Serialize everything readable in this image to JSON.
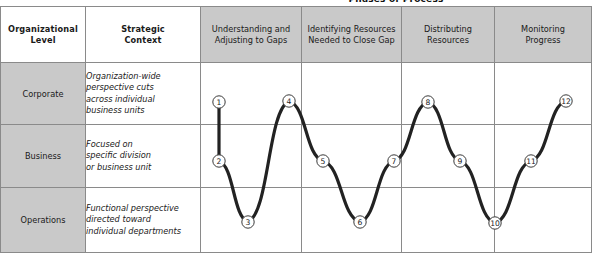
{
  "figure": {
    "super_title": "Phases of Process"
  },
  "table": {
    "headers": {
      "level": "Organizational\nLevel",
      "level_line1": "Organizational",
      "level_line2": "Level",
      "context_line1": "Strategic",
      "context_line2": "Context",
      "phases": [
        {
          "line1": "Understanding and",
          "line2": "Adjusting to Gaps"
        },
        {
          "line1": "Identifying Resources",
          "line2": "Needed to Close Gap"
        },
        {
          "line1": "Distributing",
          "line2": "Resources"
        },
        {
          "line1": "Monitoring",
          "line2": "Progress"
        }
      ]
    },
    "rows": [
      {
        "level": "Corporate",
        "context_lines": [
          "Organization-wide",
          "perspective cuts",
          "across individual",
          "business units"
        ]
      },
      {
        "level": "Business",
        "context_lines": [
          "Focused on",
          "specific division",
          "or business unit"
        ]
      },
      {
        "level": "Operations",
        "context_lines": [
          "Functional perspective",
          "directed toward",
          "individual departments"
        ]
      }
    ]
  },
  "chart_data": {
    "type": "line",
    "title": "Phases of Process",
    "xlabel": "",
    "ylabel": "Organizational Level",
    "grid": true,
    "legend": "none",
    "y_categories": [
      "Corporate",
      "Business",
      "Operations"
    ],
    "x_categories": [
      "Understanding and Adjusting to Gaps",
      "Identifying Resources Needed to Close Gap",
      "Distributing Resources",
      "Monitoring Progress"
    ],
    "series": [
      {
        "name": "Process sequence",
        "points": [
          {
            "label": "1",
            "x": 219,
            "y": 102,
            "level": "Corporate",
            "phase": "Understanding and Adjusting to Gaps"
          },
          {
            "label": "2",
            "x": 219,
            "y": 161,
            "level": "Business",
            "phase": "Understanding and Adjusting to Gaps"
          },
          {
            "label": "3",
            "x": 248,
            "y": 222,
            "level": "Operations",
            "phase": "Understanding and Adjusting to Gaps"
          },
          {
            "label": "4",
            "x": 289,
            "y": 101,
            "level": "Corporate",
            "phase": "Understanding and Adjusting to Gaps"
          },
          {
            "label": "5",
            "x": 323,
            "y": 161,
            "level": "Business",
            "phase": "Identifying Resources Needed to Close Gap"
          },
          {
            "label": "6",
            "x": 360,
            "y": 222,
            "level": "Operations",
            "phase": "Identifying Resources Needed to Close Gap"
          },
          {
            "label": "7",
            "x": 394,
            "y": 161,
            "level": "Business",
            "phase": "Identifying Resources Needed to Close Gap"
          },
          {
            "label": "8",
            "x": 428,
            "y": 102,
            "level": "Corporate",
            "phase": "Distributing Resources"
          },
          {
            "label": "9",
            "x": 460,
            "y": 161,
            "level": "Business",
            "phase": "Distributing Resources"
          },
          {
            "label": "10",
            "x": 495,
            "y": 223,
            "level": "Operations",
            "phase": "Distributing Resources"
          },
          {
            "label": "11",
            "x": 531,
            "y": 161,
            "level": "Monitoring",
            "phase": "Monitoring Progress"
          },
          {
            "label": "12",
            "x": 566,
            "y": 101,
            "level": "Corporate",
            "phase": "Monitoring Progress"
          }
        ]
      }
    ]
  },
  "colors": {
    "header_gray": "#c9c9c9",
    "level_gray": "#c9c9c9",
    "grid_line": "#8a8a8a",
    "curve": "#222222",
    "node_stroke": "#3a3a3a",
    "background": "#ffffff"
  }
}
